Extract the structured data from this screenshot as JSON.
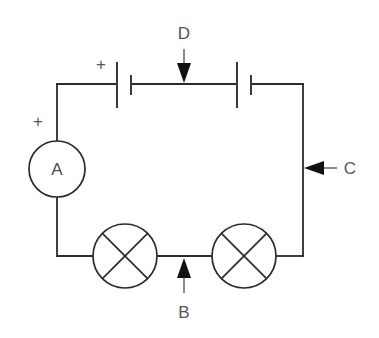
{
  "diagram": {
    "type": "electrical-circuit-schematic",
    "background_color": "#ffffff",
    "wire_color": "#2b2b2b",
    "label_color": "#555555",
    "pointer_color": "#111111",
    "canvas": {
      "width": 379,
      "height": 338
    }
  },
  "components": {
    "ammeter": {
      "symbol_letter": "A",
      "terminal_marker": "+",
      "center_x": 57,
      "center_y": 169,
      "radius": 28
    },
    "cell_left": {
      "terminal_marker": "+",
      "long_plate_x": 117,
      "short_plate_x": 131
    },
    "cell_right": {
      "long_plate_x": 237,
      "short_plate_x": 251
    },
    "lamp_left": {
      "center_x": 125,
      "center_y": 256,
      "radius": 32
    },
    "lamp_right": {
      "center_x": 244,
      "center_y": 256,
      "radius": 32
    }
  },
  "callouts": [
    {
      "id": "d",
      "label": "D",
      "points_to": "top-wire-between-cells",
      "direction": "down",
      "label_x": 184,
      "label_y": 33
    },
    {
      "id": "c",
      "label": "C",
      "points_to": "right-vertical-wire",
      "direction": "left",
      "label_x": 350,
      "label_y": 174
    },
    {
      "id": "b",
      "label": "B",
      "points_to": "bottom-wire-between-lamps",
      "direction": "up",
      "label_x": 184,
      "label_y": 318
    }
  ],
  "loop": {
    "left_x": 57,
    "right_x": 303,
    "top_y": 84,
    "bottom_y": 256
  }
}
